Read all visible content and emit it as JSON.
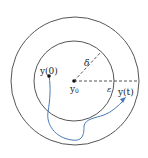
{
  "diagram": {
    "labels": {
      "initial_point": "y(0)",
      "initial_point_base": "y",
      "initial_point_arg": "(0)",
      "equilibrium_base": "y",
      "equilibrium_sub": "0",
      "trajectory_point_base": "y",
      "trajectory_point_arg": "(t)",
      "delta": "δ",
      "epsilon": "ε"
    },
    "colors": {
      "circle": "#555555",
      "dashed": "#555555",
      "trajectory": "#4a7ab5",
      "point": "#111111"
    },
    "shapes": {
      "outer_circle": {
        "cx": 75,
        "cy": 81,
        "r": 64,
        "meaning": "epsilon-ball"
      },
      "inner_circle": {
        "cx": 74,
        "cy": 81,
        "r": 40,
        "meaning": "delta-ball"
      },
      "equilibrium": {
        "x": 74,
        "y": 81
      },
      "initial": {
        "x": 49,
        "y": 76
      }
    }
  }
}
